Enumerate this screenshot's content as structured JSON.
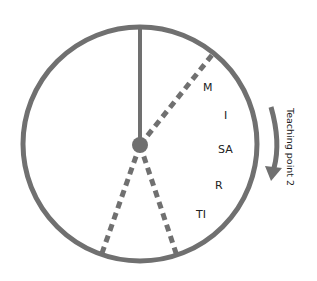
{
  "diagram": {
    "colors": {
      "stroke": "#707070",
      "text": "#222222"
    },
    "segment_labels": [
      "M",
      "I",
      "SA",
      "R",
      "TI"
    ],
    "side_label": "Teaching point 2"
  }
}
